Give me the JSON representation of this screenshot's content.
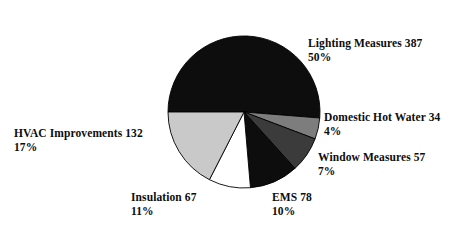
{
  "chart_data": {
    "type": "pie",
    "title": "",
    "categories": [
      "Lighting Measures",
      "Domestic Hot Water",
      "Window Measures",
      "EMS",
      "Insulation",
      "HVAC Improvements"
    ],
    "values": [
      387,
      34,
      57,
      78,
      67,
      132
    ],
    "percents": [
      50,
      4,
      7,
      10,
      11,
      17
    ],
    "total": 755,
    "legend_position": "callout-labels",
    "grid": false,
    "start_angle_deg": 180,
    "direction": "clockwise",
    "slices": [
      {
        "name": "Lighting Measures",
        "value": 387,
        "percent": 50,
        "label_text": "Lighting Measures 387",
        "percent_text": "50%",
        "color": "#0d0d0d",
        "stroke": "#000000"
      },
      {
        "name": "Domestic Hot Water",
        "value": 34,
        "percent": 4,
        "label_text": "Domestic Hot Water 34",
        "percent_text": "4%",
        "color": "#7d7d7d",
        "stroke": "#000000"
      },
      {
        "name": "Window Measures",
        "value": 57,
        "percent": 7,
        "label_text": "Window Measures 57",
        "percent_text": "7%",
        "color": "#3b3b3b",
        "stroke": "#000000"
      },
      {
        "name": "EMS",
        "value": 78,
        "percent": 10,
        "label_text": "EMS 78",
        "percent_text": "10%",
        "color": "#0d0d0d",
        "stroke": "#000000"
      },
      {
        "name": "Insulation",
        "value": 67,
        "percent": 11,
        "label_text": "Insulation 67",
        "percent_text": "11%",
        "color": "#ffffff",
        "stroke": "#000000"
      },
      {
        "name": "HVAC Improvements",
        "value": 132,
        "percent": 17,
        "label_text": "HVAC Improvements 132",
        "percent_text": "17%",
        "color": "#c9c9c9",
        "stroke": "#000000"
      }
    ],
    "geometry": {
      "center_x": 244,
      "center_y": 112,
      "radius": 76
    },
    "background_color": "#ffffff"
  }
}
